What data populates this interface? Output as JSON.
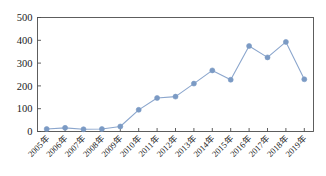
{
  "chart_data": {
    "type": "line",
    "title": "",
    "subtitle": "",
    "xlabel": "",
    "ylabel": "",
    "categories": [
      "2005年",
      "2006年",
      "2007年",
      "2008年",
      "2009年",
      "2010年",
      "2011年",
      "2012年",
      "2013年",
      "2014年",
      "2015年",
      "2016年",
      "2017年",
      "2018年",
      "2019年"
    ],
    "values": [
      11,
      16,
      10,
      11,
      22,
      95,
      147,
      153,
      210,
      268,
      227,
      375,
      325,
      393,
      229
    ],
    "series": [
      {
        "name": "",
        "values": [
          11,
          16,
          10,
          11,
          22,
          95,
          147,
          153,
          210,
          268,
          227,
          375,
          325,
          393,
          229
        ]
      }
    ],
    "ylim": [
      0,
      500
    ],
    "yticks": [
      0,
      100,
      200,
      300,
      400,
      500
    ],
    "ytick_labels": [
      "0",
      "100",
      "200",
      "300",
      "400",
      "500"
    ],
    "grid": false,
    "legend": "none",
    "xtick_rotation": -45,
    "marker": "circle",
    "line_color": "#8ba6cd",
    "marker_color": "#7b9ac4",
    "axis_color": "#4d4d4d",
    "background": "#ffffff"
  }
}
